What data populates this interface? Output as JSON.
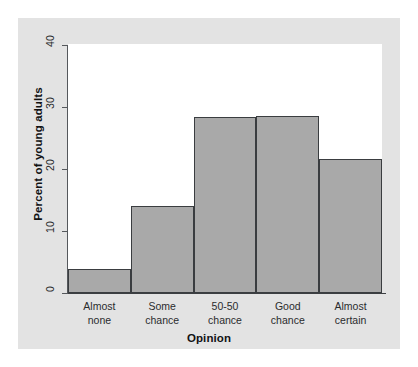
{
  "chart_data": {
    "type": "bar",
    "title": "",
    "subtitle": "",
    "xlabel": "Opinion",
    "ylabel": "Percent of young adults",
    "categories": [
      "Almost\nnone",
      "Some\nchance",
      "50-50\nchance",
      "Good\nchance",
      "Almost\ncertain"
    ],
    "category_lines": [
      [
        "Almost",
        "none"
      ],
      [
        "Some",
        "chance"
      ],
      [
        "50-50",
        "chance"
      ],
      [
        "Good",
        "chance"
      ],
      [
        "Almost",
        "certain"
      ]
    ],
    "values": [
      4.0,
      14.6,
      29.4,
      29.6,
      22.5
    ],
    "ylim": [
      0,
      41.5
    ],
    "yticks": [
      0,
      10,
      20,
      30,
      40
    ],
    "ytick_labels": [
      "0",
      "10",
      "20",
      "30",
      "40"
    ],
    "grid": false,
    "legend": "none",
    "bar_fill_color": "#a9a9a9",
    "bar_border_color": "#3a3d40",
    "panel_color": "#e3e3e3",
    "plot_background": "#ffffff",
    "axis_color": "#3c3f42",
    "bars_contiguous": true
  }
}
